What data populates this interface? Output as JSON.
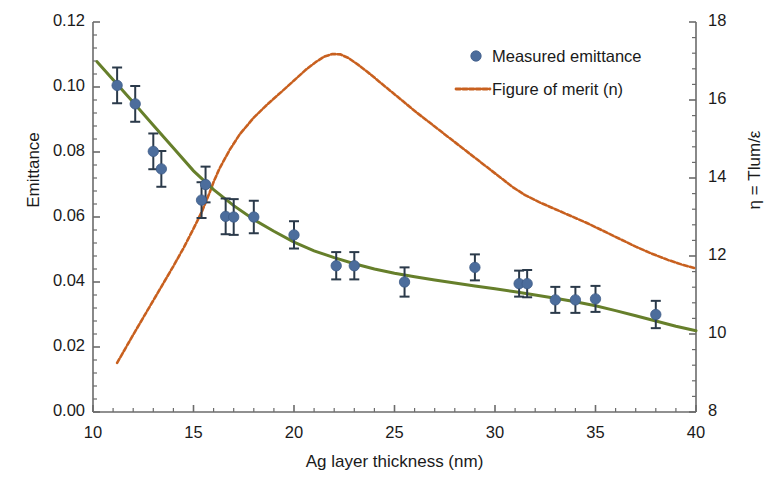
{
  "chart_data": {
    "type": "scatter",
    "title": "",
    "xlabel": "Ag layer thickness (nm)",
    "ylabel": "Emittance",
    "y2label": "η = Tlum/ε",
    "xlim": [
      10,
      40
    ],
    "ylim": [
      0.0,
      0.12
    ],
    "y2lim": [
      8,
      18
    ],
    "xticks": [
      10,
      15,
      20,
      25,
      30,
      35,
      40
    ],
    "xticklabels": [
      "10",
      "15",
      "20",
      "25",
      "30",
      "35",
      "40"
    ],
    "yticks": [
      0.0,
      0.02,
      0.04,
      0.06,
      0.08,
      0.1,
      0.12
    ],
    "yticklabels": [
      "0.00",
      "0.02",
      "0.04",
      "0.06",
      "0.08",
      "0.10",
      "0.12"
    ],
    "y2ticks": [
      8,
      10,
      12,
      14,
      16,
      18
    ],
    "y2ticklabels": [
      "8",
      "10",
      "12",
      "14",
      "16",
      "18"
    ],
    "minor_ticks_per_major": 4,
    "grid": false,
    "legend_position": "top-right",
    "series": [
      {
        "name": "Measured emittance",
        "type": "scatter",
        "axis": "left",
        "marker": "circle",
        "color": "#4c6d9c",
        "errorbar_color": "#2b3a4a",
        "points": [
          {
            "x": 11.2,
            "y": 0.1005,
            "yerr": 0.0055
          },
          {
            "x": 12.1,
            "y": 0.0948,
            "yerr": 0.0055
          },
          {
            "x": 13.0,
            "y": 0.0802,
            "yerr": 0.0055
          },
          {
            "x": 13.4,
            "y": 0.0748,
            "yerr": 0.0055
          },
          {
            "x": 15.6,
            "y": 0.07,
            "yerr": 0.0055
          },
          {
            "x": 15.4,
            "y": 0.0652,
            "yerr": 0.0055
          },
          {
            "x": 16.6,
            "y": 0.0602,
            "yerr": 0.0055
          },
          {
            "x": 17.0,
            "y": 0.06,
            "yerr": 0.0055
          },
          {
            "x": 18.0,
            "y": 0.06,
            "yerr": 0.005
          },
          {
            "x": 20.0,
            "y": 0.0545,
            "yerr": 0.0042
          },
          {
            "x": 22.1,
            "y": 0.045,
            "yerr": 0.0042
          },
          {
            "x": 23.0,
            "y": 0.045,
            "yerr": 0.0042
          },
          {
            "x": 25.5,
            "y": 0.04,
            "yerr": 0.0045
          },
          {
            "x": 29.0,
            "y": 0.0445,
            "yerr": 0.004
          },
          {
            "x": 31.2,
            "y": 0.0395,
            "yerr": 0.004
          },
          {
            "x": 31.6,
            "y": 0.0395,
            "yerr": 0.0042
          },
          {
            "x": 33.0,
            "y": 0.0345,
            "yerr": 0.004
          },
          {
            "x": 34.0,
            "y": 0.0345,
            "yerr": 0.004
          },
          {
            "x": 35.0,
            "y": 0.0348,
            "yerr": 0.004
          },
          {
            "x": 38.0,
            "y": 0.03,
            "yerr": 0.0042
          }
        ]
      },
      {
        "name": "Emittance fit",
        "type": "line",
        "axis": "left",
        "color": "#667f2b",
        "style": "solid",
        "points": [
          {
            "x": 10.2,
            "y": 0.1078
          },
          {
            "x": 11.0,
            "y": 0.1022
          },
          {
            "x": 12.0,
            "y": 0.0953
          },
          {
            "x": 13.0,
            "y": 0.0882
          },
          {
            "x": 14.0,
            "y": 0.0812
          },
          {
            "x": 15.0,
            "y": 0.0742
          },
          {
            "x": 16.0,
            "y": 0.0684
          },
          {
            "x": 17.0,
            "y": 0.0635
          },
          {
            "x": 18.0,
            "y": 0.0592
          },
          {
            "x": 19.0,
            "y": 0.0556
          },
          {
            "x": 20.0,
            "y": 0.0523
          },
          {
            "x": 21.0,
            "y": 0.0496
          },
          {
            "x": 22.0,
            "y": 0.0475
          },
          {
            "x": 23.0,
            "y": 0.0456
          },
          {
            "x": 24.0,
            "y": 0.044
          },
          {
            "x": 25.0,
            "y": 0.0427
          },
          {
            "x": 26.0,
            "y": 0.0416
          },
          {
            "x": 27.0,
            "y": 0.0406
          },
          {
            "x": 28.0,
            "y": 0.0397
          },
          {
            "x": 29.0,
            "y": 0.0388
          },
          {
            "x": 30.0,
            "y": 0.0379
          },
          {
            "x": 31.0,
            "y": 0.037
          },
          {
            "x": 32.0,
            "y": 0.036
          },
          {
            "x": 33.0,
            "y": 0.035
          },
          {
            "x": 34.0,
            "y": 0.0339
          },
          {
            "x": 35.0,
            "y": 0.0327
          },
          {
            "x": 36.0,
            "y": 0.0312
          },
          {
            "x": 37.0,
            "y": 0.0296
          },
          {
            "x": 38.0,
            "y": 0.028
          },
          {
            "x": 39.0,
            "y": 0.0264
          },
          {
            "x": 40.0,
            "y": 0.025
          }
        ]
      },
      {
        "name": "Figure of merit (n)",
        "type": "line",
        "axis": "right",
        "color": "#c8601f",
        "style": "dashed",
        "points": [
          {
            "x": 11.2,
            "y": 9.26
          },
          {
            "x": 11.6,
            "y": 9.62
          },
          {
            "x": 12.0,
            "y": 9.98
          },
          {
            "x": 12.5,
            "y": 10.42
          },
          {
            "x": 13.0,
            "y": 10.86
          },
          {
            "x": 13.5,
            "y": 11.3
          },
          {
            "x": 14.0,
            "y": 11.74
          },
          {
            "x": 14.5,
            "y": 12.2
          },
          {
            "x": 15.0,
            "y": 12.7
          },
          {
            "x": 15.4,
            "y": 13.12
          },
          {
            "x": 15.8,
            "y": 13.62
          },
          {
            "x": 16.0,
            "y": 13.9
          },
          {
            "x": 16.3,
            "y": 14.25
          },
          {
            "x": 16.8,
            "y": 14.72
          },
          {
            "x": 17.3,
            "y": 15.12
          },
          {
            "x": 18.0,
            "y": 15.55
          },
          {
            "x": 18.7,
            "y": 15.9
          },
          {
            "x": 19.4,
            "y": 16.22
          },
          {
            "x": 20.0,
            "y": 16.5
          },
          {
            "x": 20.6,
            "y": 16.78
          },
          {
            "x": 21.1,
            "y": 16.98
          },
          {
            "x": 21.5,
            "y": 17.11
          },
          {
            "x": 21.9,
            "y": 17.18
          },
          {
            "x": 22.3,
            "y": 17.17
          },
          {
            "x": 22.7,
            "y": 17.08
          },
          {
            "x": 23.2,
            "y": 16.9
          },
          {
            "x": 23.8,
            "y": 16.66
          },
          {
            "x": 24.5,
            "y": 16.36
          },
          {
            "x": 25.3,
            "y": 16.02
          },
          {
            "x": 26.1,
            "y": 15.68
          },
          {
            "x": 27.0,
            "y": 15.32
          },
          {
            "x": 27.9,
            "y": 14.96
          },
          {
            "x": 28.8,
            "y": 14.6
          },
          {
            "x": 29.6,
            "y": 14.28
          },
          {
            "x": 30.3,
            "y": 14.0
          },
          {
            "x": 30.9,
            "y": 13.76
          },
          {
            "x": 31.5,
            "y": 13.56
          },
          {
            "x": 32.2,
            "y": 13.38
          },
          {
            "x": 33.0,
            "y": 13.2
          },
          {
            "x": 33.8,
            "y": 13.02
          },
          {
            "x": 34.6,
            "y": 12.84
          },
          {
            "x": 35.4,
            "y": 12.64
          },
          {
            "x": 36.2,
            "y": 12.44
          },
          {
            "x": 37.0,
            "y": 12.24
          },
          {
            "x": 37.8,
            "y": 12.06
          },
          {
            "x": 38.6,
            "y": 11.9
          },
          {
            "x": 39.3,
            "y": 11.78
          },
          {
            "x": 40.0,
            "y": 11.68
          }
        ]
      }
    ]
  },
  "legend": {
    "items": [
      {
        "label": "Measured emittance",
        "marker": "dot",
        "color": "#4c6d9c"
      },
      {
        "label": "Figure of merit (n)",
        "marker": "dashed-line",
        "color": "#c8601f"
      }
    ]
  }
}
